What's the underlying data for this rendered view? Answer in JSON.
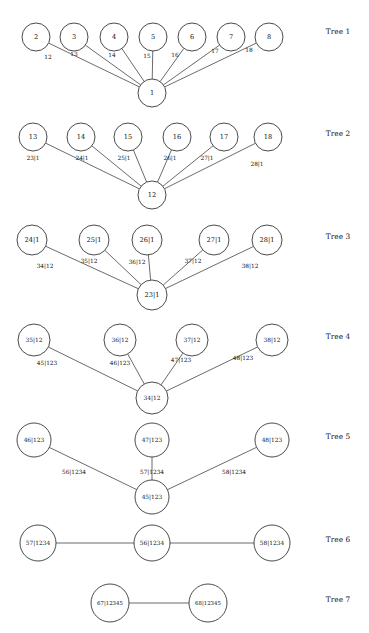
{
  "figure": {
    "title": "",
    "background_color": "#ffffff",
    "node_fill": "#ffffff",
    "node_stroke": "#2b2b2b",
    "edge_stroke": "#3a3a3a",
    "text_color": "#101010"
  },
  "chart_data": {
    "type": "diagram",
    "diagram_kind": "regular-vine-tree-sequence",
    "title": "",
    "xlabel": "",
    "ylabel": "",
    "grid": false,
    "legend": null,
    "tree_count": 7,
    "trees": [
      {
        "label": "Tree 1",
        "label_x": 338,
        "label_y": 34,
        "node_radius": 14,
        "root": {
          "id": "1",
          "text": "1",
          "x": 152,
          "y": 93
        },
        "nodes": [
          {
            "id": "2",
            "text": "2",
            "x": 36,
            "y": 37
          },
          {
            "id": "3",
            "text": "3",
            "x": 74,
            "y": 37
          },
          {
            "id": "4",
            "text": "4",
            "x": 114,
            "y": 37
          },
          {
            "id": "5",
            "text": "5",
            "x": 153,
            "y": 37
          },
          {
            "id": "6",
            "text": "6",
            "x": 192,
            "y": 37
          },
          {
            "id": "7",
            "text": "7",
            "x": 231,
            "y": 37
          },
          {
            "id": "8",
            "text": "8",
            "x": 269,
            "y": 37
          }
        ],
        "edges": [
          {
            "from": "2",
            "to": "1",
            "label": "12",
            "label_x": 48,
            "label_y": 57
          },
          {
            "from": "3",
            "to": "1",
            "label": "13",
            "label_x": 74,
            "label_y": 54
          },
          {
            "from": "4",
            "to": "1",
            "label": "14",
            "label_x": 112,
            "label_y": 55
          },
          {
            "from": "5",
            "to": "1",
            "label": "15",
            "label_x": 147,
            "label_y": 56
          },
          {
            "from": "6",
            "to": "1",
            "label": "16",
            "label_x": 175,
            "label_y": 55
          },
          {
            "from": "7",
            "to": "1",
            "label": "17",
            "label_x": 215,
            "label_y": 51
          },
          {
            "from": "8",
            "to": "1",
            "label": "18",
            "label_x": 249,
            "label_y": 50
          }
        ]
      },
      {
        "label": "Tree 2",
        "label_x": 338,
        "label_y": 136,
        "node_radius": 14,
        "root": {
          "id": "12",
          "text": "12",
          "x": 152,
          "y": 195
        },
        "nodes": [
          {
            "id": "13",
            "text": "13",
            "x": 33,
            "y": 137
          },
          {
            "id": "14",
            "text": "14",
            "x": 81,
            "y": 137
          },
          {
            "id": "15",
            "text": "15",
            "x": 128,
            "y": 137
          },
          {
            "id": "16",
            "text": "16",
            "x": 177,
            "y": 137
          },
          {
            "id": "17",
            "text": "17",
            "x": 224,
            "y": 137
          },
          {
            "id": "18",
            "text": "18",
            "x": 268,
            "y": 137
          }
        ],
        "edges": [
          {
            "from": "13",
            "to": "12",
            "label": "23|1",
            "label_x": 33,
            "label_y": 158
          },
          {
            "from": "14",
            "to": "12",
            "label": "24|1",
            "label_x": 82,
            "label_y": 158
          },
          {
            "from": "15",
            "to": "12",
            "label": "25|1",
            "label_x": 124,
            "label_y": 158
          },
          {
            "from": "16",
            "to": "12",
            "label": "26|1",
            "label_x": 170,
            "label_y": 158
          },
          {
            "from": "17",
            "to": "12",
            "label": "27|1",
            "label_x": 207,
            "label_y": 158
          },
          {
            "from": "18",
            "to": "12",
            "label": "28|1",
            "label_x": 257,
            "label_y": 164
          }
        ]
      },
      {
        "label": "Tree 3",
        "label_x": 338,
        "label_y": 239,
        "node_radius": 15,
        "root": {
          "id": "23|1",
          "text": "23|1",
          "x": 152,
          "y": 295
        },
        "nodes": [
          {
            "id": "24|1",
            "text": "24|1",
            "x": 32,
            "y": 240
          },
          {
            "id": "25|1",
            "text": "25|1",
            "x": 94,
            "y": 240
          },
          {
            "id": "26|1",
            "text": "26|1",
            "x": 147,
            "y": 240
          },
          {
            "id": "27|1",
            "text": "27|1",
            "x": 214,
            "y": 240
          },
          {
            "id": "28|1",
            "text": "28|1",
            "x": 267,
            "y": 240
          }
        ],
        "edges": [
          {
            "from": "24|1",
            "to": "23|1",
            "label": "34|12",
            "label_x": 45,
            "label_y": 266
          },
          {
            "from": "25|1",
            "to": "23|1",
            "label": "35|12",
            "label_x": 89,
            "label_y": 261
          },
          {
            "from": "26|1",
            "to": "23|1",
            "label": "36|12",
            "label_x": 137,
            "label_y": 262
          },
          {
            "from": "27|1",
            "to": "23|1",
            "label": "37|12",
            "label_x": 193,
            "label_y": 261
          },
          {
            "from": "28|1",
            "to": "23|1",
            "label": "38|12",
            "label_x": 250,
            "label_y": 266
          }
        ]
      },
      {
        "label": "Tree 4",
        "label_x": 338,
        "label_y": 339,
        "node_radius": 16,
        "root": {
          "id": "34|12",
          "text": "34|12",
          "x": 152,
          "y": 398
        },
        "nodes": [
          {
            "id": "35|12",
            "text": "35|12",
            "x": 34,
            "y": 340
          },
          {
            "id": "36|12",
            "text": "36|12",
            "x": 120,
            "y": 340
          },
          {
            "id": "37|12",
            "text": "37|12",
            "x": 192,
            "y": 340
          },
          {
            "id": "38|12",
            "text": "38|12",
            "x": 272,
            "y": 340
          }
        ],
        "edges": [
          {
            "from": "35|12",
            "to": "34|12",
            "label": "45|123",
            "label_x": 47,
            "label_y": 363
          },
          {
            "from": "36|12",
            "to": "34|12",
            "label": "46|123",
            "label_x": 120,
            "label_y": 363
          },
          {
            "from": "37|12",
            "to": "34|12",
            "label": "47|123",
            "label_x": 181,
            "label_y": 360
          },
          {
            "from": "38|12",
            "to": "34|12",
            "label": "48|123",
            "label_x": 243,
            "label_y": 358
          }
        ]
      },
      {
        "label": "Tree 5",
        "label_x": 338,
        "label_y": 439,
        "node_radius": 17,
        "root": {
          "id": "45|123",
          "text": "45|123",
          "x": 152,
          "y": 497
        },
        "nodes": [
          {
            "id": "46|123",
            "text": "46|123",
            "x": 34,
            "y": 440
          },
          {
            "id": "47|123",
            "text": "47|123",
            "x": 152,
            "y": 440
          },
          {
            "id": "48|123",
            "text": "48|123",
            "x": 272,
            "y": 440
          }
        ],
        "edges": [
          {
            "from": "46|123",
            "to": "45|123",
            "label": "56|1234",
            "label_x": 74,
            "label_y": 472
          },
          {
            "from": "47|123",
            "to": "45|123",
            "label": "57|1234",
            "label_x": 152,
            "label_y": 472
          },
          {
            "from": "48|123",
            "to": "45|123",
            "label": "58|1234",
            "label_x": 234,
            "label_y": 472
          }
        ]
      },
      {
        "label": "Tree 6",
        "label_x": 338,
        "label_y": 542,
        "node_radius": 18,
        "root": {
          "id": "56|1234",
          "text": "56|1234",
          "x": 152,
          "y": 543
        },
        "nodes": [
          {
            "id": "57|1234",
            "text": "57|1234",
            "x": 38,
            "y": 543
          },
          {
            "id": "58|1234",
            "text": "58|1234",
            "x": 272,
            "y": 543
          }
        ],
        "edges": [
          {
            "from": "57|1234",
            "to": "56|1234",
            "label": "",
            "label_x": 95,
            "label_y": 536
          },
          {
            "from": "58|1234",
            "to": "56|1234",
            "label": "",
            "label_x": 212,
            "label_y": 536
          }
        ]
      },
      {
        "label": "Tree 7",
        "label_x": 338,
        "label_y": 602,
        "node_radius": 19,
        "root": {
          "id": "68|12345",
          "text": "68|12345",
          "x": 208,
          "y": 603
        },
        "nodes": [
          {
            "id": "67|12345",
            "text": "67|12345",
            "x": 110,
            "y": 603
          }
        ],
        "edges": [
          {
            "from": "67|12345",
            "to": "68|12345",
            "label": "",
            "label_x": 159,
            "label_y": 596
          }
        ]
      }
    ]
  }
}
